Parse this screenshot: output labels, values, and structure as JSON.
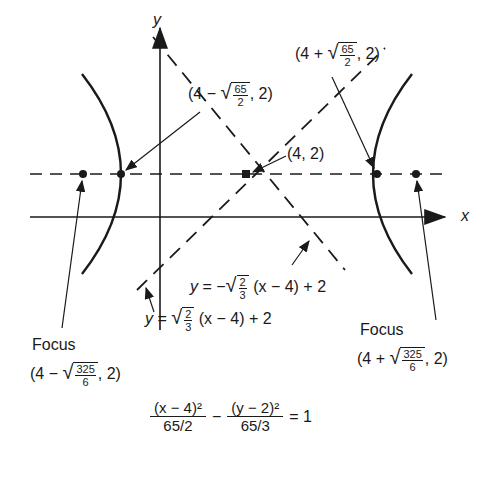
{
  "diagram": {
    "axes": {
      "x_label": "x",
      "y_label": "y"
    },
    "center": {
      "label": "(4, 2)"
    },
    "vertex_left": {
      "prefix": "(4 − ",
      "rad_num": "65",
      "rad_den": "2",
      "suffix": ", 2)"
    },
    "vertex_right": {
      "prefix": "(4 + ",
      "rad_num": "65",
      "rad_den": "2",
      "suffix": ", 2)"
    },
    "focus_left": {
      "title": "Focus",
      "prefix": "(4 − ",
      "rad_num": "325",
      "rad_den": "6",
      "suffix": ", 2)"
    },
    "focus_right": {
      "title": "Focus",
      "prefix": "(4 + ",
      "rad_num": "325",
      "rad_den": "6",
      "suffix": ", 2)"
    },
    "asymptote_neg": {
      "lhs": "y",
      "eq": " = −",
      "rad_num": "2",
      "rad_den": "3",
      "rhs": " (x − 4) + 2"
    },
    "asymptote_pos": {
      "lhs": "y",
      "eq": " = ",
      "rad_num": "2",
      "rad_den": "3",
      "rhs": " (x − 4) + 2"
    },
    "equation": {
      "term1_num": "(x − 4)²",
      "term1_den": "65/2",
      "minus": "−",
      "term2_num": "(y − 2)²",
      "term2_den": "65/3",
      "rhs": "= 1"
    }
  }
}
